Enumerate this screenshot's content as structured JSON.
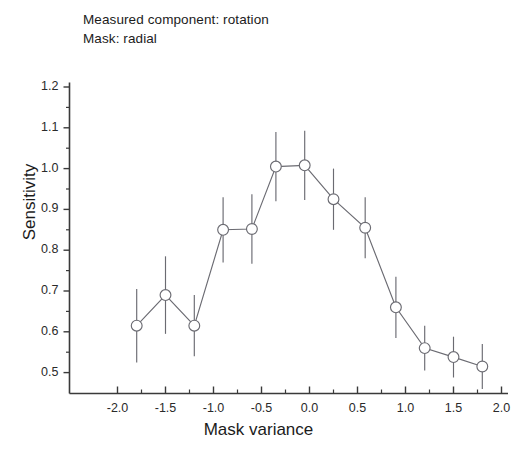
{
  "annotations": {
    "line1": "Measured component: rotation",
    "line2": "Mask: radial"
  },
  "axes": {
    "xlabel": "Mask variance",
    "ylabel": "Sensitivity",
    "x_ticks": [
      "-2.0",
      "-1.5",
      "-1.0",
      "-0.5",
      "0.0",
      "0.5",
      "1.0",
      "1.5",
      "2.0"
    ],
    "y_ticks": [
      "1.2",
      "1.1",
      "1.0",
      "0.9",
      "0.8",
      "0.7",
      "0.6",
      "0.5"
    ]
  },
  "style": {
    "line_color": "#6b6b72",
    "marker_edge": "#6b6b72",
    "marker_face": "#ffffff",
    "axis_color": "#3a3a3a",
    "text_color": "#1b1b1b"
  },
  "chart_data": {
    "type": "line",
    "title": "",
    "subtitle": "Measured component: rotation / Mask: radial",
    "xlabel": "Mask variance",
    "ylabel": "Sensitivity",
    "xlim": [
      -2.1,
      2.1
    ],
    "ylim": [
      0.45,
      1.25
    ],
    "grid": false,
    "legend": null,
    "marker": "open-circle",
    "error_bars": "symmetric-vertical",
    "x": [
      -1.8,
      -1.5,
      -1.2,
      -0.9,
      -0.6,
      -0.35,
      -0.05,
      0.25,
      0.58,
      0.9,
      1.2,
      1.5,
      1.8
    ],
    "y": [
      0.615,
      0.69,
      0.615,
      0.85,
      0.852,
      1.005,
      1.008,
      0.925,
      0.855,
      0.66,
      0.56,
      0.538,
      0.515
    ],
    "yerr": [
      0.09,
      0.095,
      0.075,
      0.08,
      0.085,
      0.085,
      0.085,
      0.075,
      0.075,
      0.075,
      0.055,
      0.05,
      0.055
    ],
    "series": [
      {
        "name": "rotation / radial mask",
        "points": [
          {
            "x": -1.8,
            "y": 0.615,
            "yerr": 0.09
          },
          {
            "x": -1.5,
            "y": 0.69,
            "yerr": 0.095
          },
          {
            "x": -1.2,
            "y": 0.615,
            "yerr": 0.075
          },
          {
            "x": -0.9,
            "y": 0.85,
            "yerr": 0.08
          },
          {
            "x": -0.6,
            "y": 0.852,
            "yerr": 0.085
          },
          {
            "x": -0.35,
            "y": 1.005,
            "yerr": 0.085
          },
          {
            "x": -0.05,
            "y": 1.008,
            "yerr": 0.085
          },
          {
            "x": 0.25,
            "y": 0.925,
            "yerr": 0.075
          },
          {
            "x": 0.58,
            "y": 0.855,
            "yerr": 0.075
          },
          {
            "x": 0.9,
            "y": 0.66,
            "yerr": 0.075
          },
          {
            "x": 1.2,
            "y": 0.56,
            "yerr": 0.055
          },
          {
            "x": 1.5,
            "y": 0.538,
            "yerr": 0.05
          },
          {
            "x": 1.8,
            "y": 0.515,
            "yerr": 0.055
          }
        ]
      }
    ]
  }
}
